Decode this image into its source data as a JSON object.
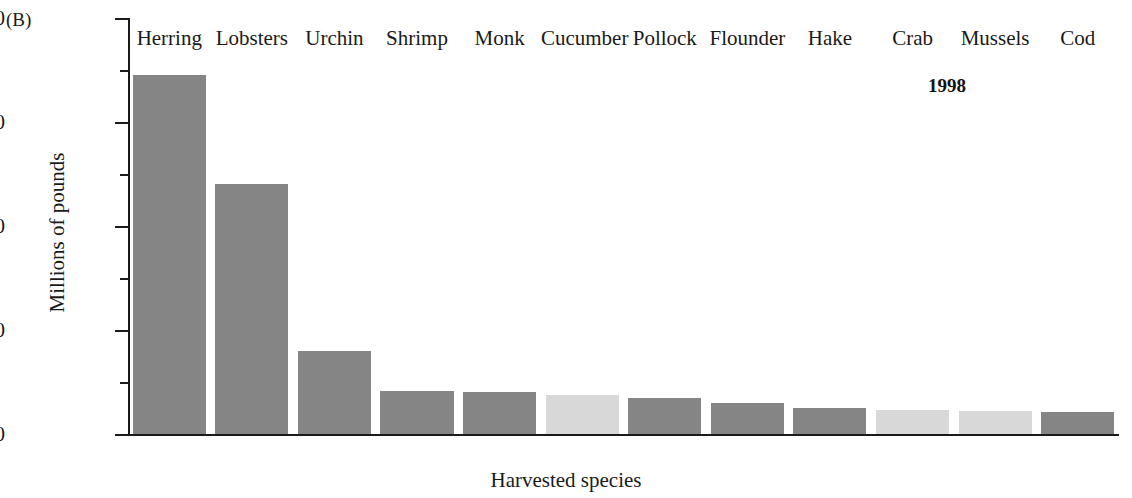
{
  "panel": {
    "label": "(B)"
  },
  "annotation": {
    "year": "1998"
  },
  "axes": {
    "y_title": "Millions of pounds",
    "x_title": "Harvested species",
    "y_major_ticks": [
      "0",
      "20",
      "40",
      "60",
      "80"
    ],
    "y_minor_ticks": [
      "10",
      "30",
      "50",
      "70"
    ]
  },
  "colors": {
    "bar_dark": "#858585",
    "bar_light": "#d8d8d8",
    "axis": "#1a1a1a",
    "background": "#ffffff"
  },
  "chart_data": {
    "type": "bar",
    "title": "",
    "subtitle": "",
    "xlabel": "Harvested species",
    "ylabel": "Millions of pounds",
    "ylim": [
      0,
      80
    ],
    "ytick_values": [
      0,
      20,
      40,
      60,
      80
    ],
    "yminor_tick_values": [
      10,
      30,
      50,
      70
    ],
    "grid": false,
    "legend": false,
    "annotations": [
      {
        "text": "1998",
        "position": "upper-right",
        "bold": true
      },
      {
        "text": "(B)",
        "position": "upper-left",
        "bold": false
      }
    ],
    "categories": [
      "Herring",
      "Lobsters",
      "Urchin",
      "Shrimp",
      "Monk",
      "Cucumber",
      "Pollock",
      "Flounder",
      "Hake",
      "Crab",
      "Mussels",
      "Cod"
    ],
    "values": [
      69,
      48,
      16,
      8.3,
      8,
      7.5,
      7,
      6,
      5,
      4.6,
      4.5,
      4.2
    ],
    "shades": [
      "dark",
      "dark",
      "dark",
      "dark",
      "dark",
      "light",
      "dark",
      "dark",
      "dark",
      "light",
      "light",
      "dark"
    ],
    "bars": [
      {
        "label": "Herring",
        "value": 69,
        "shade": "dark"
      },
      {
        "label": "Lobsters",
        "value": 48,
        "shade": "dark"
      },
      {
        "label": "Urchin",
        "value": 16,
        "shade": "dark"
      },
      {
        "label": "Shrimp",
        "value": 8.3,
        "shade": "dark"
      },
      {
        "label": "Monk",
        "value": 8,
        "shade": "dark"
      },
      {
        "label": "Cucumber",
        "value": 7.5,
        "shade": "light"
      },
      {
        "label": "Pollock",
        "value": 7,
        "shade": "dark"
      },
      {
        "label": "Flounder",
        "value": 6,
        "shade": "dark"
      },
      {
        "label": "Hake",
        "value": 5,
        "shade": "dark"
      },
      {
        "label": "Crab",
        "value": 4.6,
        "shade": "light"
      },
      {
        "label": "Mussels",
        "value": 4.5,
        "shade": "light"
      },
      {
        "label": "Cod",
        "value": 4.2,
        "shade": "dark"
      }
    ]
  }
}
